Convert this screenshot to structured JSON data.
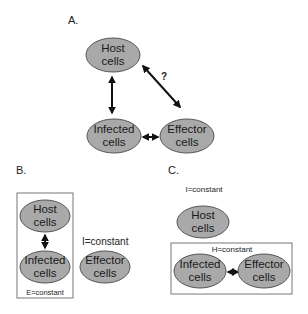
{
  "panels": {
    "a": {
      "label": "A.",
      "host": {
        "line1": "Host",
        "line2": "cells"
      },
      "infected": {
        "line1": "Infected",
        "line2": "cells"
      },
      "effector": {
        "line1": "Effector",
        "line2": "cells"
      },
      "question_mark": "?"
    },
    "b": {
      "label": "B.",
      "host": {
        "line1": "Host",
        "line2": "cells"
      },
      "infected": {
        "line1": "Infected",
        "line2": "cells"
      },
      "effector": {
        "line1": "Effector",
        "line2": "cells"
      },
      "box_label": "E=constant",
      "side_label": "I=constant"
    },
    "c": {
      "label": "C.",
      "host": {
        "line1": "Host",
        "line2": "cells"
      },
      "infected": {
        "line1": "Infected",
        "line2": "cells"
      },
      "effector": {
        "line1": "Effector",
        "line2": "cells"
      },
      "top_label": "I=constant",
      "box_label": "H=constant"
    }
  },
  "colors": {
    "cell_fill": "#a9a9a9",
    "cell_stroke": "#555555",
    "arrow": "#111111"
  }
}
